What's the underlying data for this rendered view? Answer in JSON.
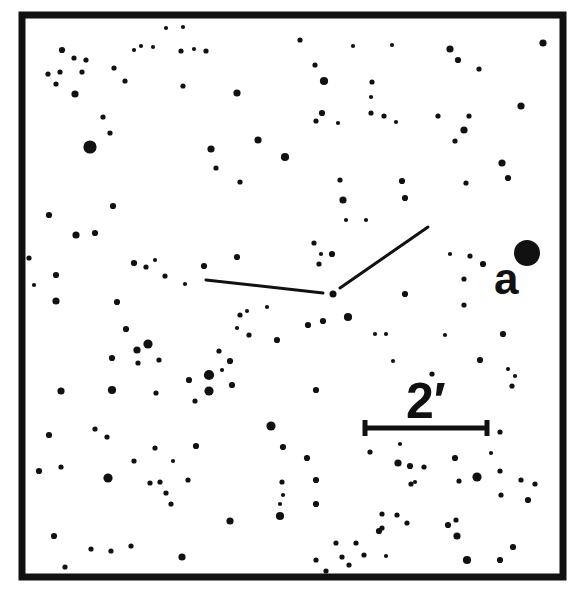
{
  "chart_data": {
    "type": "finder-chart",
    "title": "",
    "frame": {
      "x": 22,
      "y": 15,
      "width": 541,
      "height": 562,
      "stroke_width": 7
    },
    "pointer_lines": {
      "apex": {
        "x": 333,
        "y": 294
      },
      "arms": [
        {
          "from": [
            206,
            280
          ],
          "to": [
            323,
            293
          ]
        },
        {
          "from": [
            340,
            288
          ],
          "to": [
            428,
            227
          ]
        }
      ]
    },
    "labels": [
      {
        "id": "a",
        "text": "a",
        "x": 494,
        "y": 294,
        "marks_star": {
          "x": 527,
          "y": 253
        }
      }
    ],
    "scale_bar": {
      "label": "2′",
      "x1": 365,
      "x2": 487,
      "y": 428,
      "text_x": 406,
      "text_y": 418
    },
    "stars": [
      [
        62,
        50,
        5
      ],
      [
        74,
        58,
        4
      ],
      [
        86,
        60,
        4
      ],
      [
        48,
        74,
        4
      ],
      [
        60,
        72,
        4
      ],
      [
        82,
        72,
        4
      ],
      [
        56,
        84,
        4
      ],
      [
        75,
        94,
        6
      ],
      [
        114,
        68,
        4
      ],
      [
        125,
        81,
        4
      ],
      [
        134,
        50,
        3
      ],
      [
        141,
        46,
        3
      ],
      [
        153,
        47,
        3
      ],
      [
        166,
        28,
        3
      ],
      [
        183,
        27,
        3
      ],
      [
        181,
        51,
        4
      ],
      [
        194,
        49,
        3
      ],
      [
        206,
        51,
        4
      ],
      [
        183,
        86,
        4
      ],
      [
        237,
        93,
        6
      ],
      [
        103,
        117,
        4
      ],
      [
        110,
        133,
        4
      ],
      [
        90,
        147,
        12
      ],
      [
        211,
        149,
        6
      ],
      [
        216,
        168,
        4
      ],
      [
        240,
        182,
        4
      ],
      [
        258,
        140,
        6
      ],
      [
        285,
        157,
        7
      ],
      [
        300,
        40,
        4
      ],
      [
        353,
        46,
        3
      ],
      [
        392,
        45,
        3
      ],
      [
        450,
        49,
        6
      ],
      [
        458,
        60,
        5
      ],
      [
        479,
        69,
        4
      ],
      [
        315,
        65,
        4
      ],
      [
        324,
        81,
        7
      ],
      [
        372,
        82,
        4
      ],
      [
        371,
        97,
        3
      ],
      [
        384,
        116,
        4
      ],
      [
        371,
        113,
        4
      ],
      [
        396,
        122,
        3
      ],
      [
        322,
        113,
        5
      ],
      [
        316,
        121,
        4
      ],
      [
        338,
        123,
        3
      ],
      [
        438,
        116,
        4
      ],
      [
        464,
        130,
        6
      ],
      [
        469,
        116,
        4
      ],
      [
        455,
        141,
        4
      ],
      [
        521,
        106,
        6
      ],
      [
        543,
        43,
        6
      ],
      [
        502,
        163,
        6
      ],
      [
        508,
        178,
        5
      ],
      [
        466,
        183,
        4
      ],
      [
        402,
        181,
        5
      ],
      [
        405,
        198,
        5
      ],
      [
        340,
        180,
        4
      ],
      [
        49,
        215,
        5
      ],
      [
        76,
        235,
        6
      ],
      [
        95,
        233,
        5
      ],
      [
        113,
        206,
        5
      ],
      [
        29,
        258,
        4
      ],
      [
        34,
        285,
        3
      ],
      [
        56,
        275,
        5
      ],
      [
        56,
        301,
        6
      ],
      [
        134,
        263,
        5
      ],
      [
        146,
        267,
        4
      ],
      [
        155,
        260,
        3
      ],
      [
        165,
        276,
        4
      ],
      [
        185,
        284,
        3
      ],
      [
        204,
        266,
        5
      ],
      [
        237,
        257,
        5
      ],
      [
        343,
        200,
        6
      ],
      [
        346,
        220,
        3
      ],
      [
        366,
        220,
        3
      ],
      [
        314,
        243,
        4
      ],
      [
        321,
        254,
        3
      ],
      [
        319,
        264,
        4
      ],
      [
        332,
        254,
        5
      ],
      [
        450,
        254,
        3
      ],
      [
        470,
        256,
        4
      ],
      [
        483,
        264,
        5
      ],
      [
        464,
        279,
        4
      ],
      [
        464,
        305,
        4
      ],
      [
        405,
        294,
        5
      ],
      [
        219,
        351,
        4
      ],
      [
        222,
        370,
        3
      ],
      [
        230,
        361,
        5
      ],
      [
        249,
        335,
        4
      ],
      [
        240,
        315,
        4
      ],
      [
        237,
        328,
        3
      ],
      [
        247,
        311,
        3
      ],
      [
        267,
        307,
        3
      ],
      [
        277,
        340,
        5
      ],
      [
        308,
        325,
        5
      ],
      [
        323,
        321,
        5
      ],
      [
        348,
        317,
        7
      ],
      [
        117,
        302,
        5
      ],
      [
        126,
        329,
        5
      ],
      [
        137,
        350,
        6
      ],
      [
        148,
        344,
        8
      ],
      [
        112,
        358,
        5
      ],
      [
        138,
        363,
        4
      ],
      [
        112,
        390,
        7
      ],
      [
        61,
        391,
        6
      ],
      [
        95,
        429,
        4
      ],
      [
        156,
        393,
        4
      ],
      [
        209,
        375,
        9
      ],
      [
        209,
        391,
        8
      ],
      [
        232,
        385,
        5
      ],
      [
        159,
        360,
        4
      ],
      [
        195,
        401,
        4
      ],
      [
        173,
        461,
        3
      ],
      [
        189,
        380,
        5
      ],
      [
        316,
        390,
        5
      ],
      [
        375,
        334,
        3
      ],
      [
        386,
        334,
        3
      ],
      [
        445,
        335,
        3
      ],
      [
        503,
        334,
        5
      ],
      [
        480,
        360,
        5
      ],
      [
        393,
        361,
        3
      ],
      [
        432,
        374,
        4
      ],
      [
        508,
        369,
        3
      ],
      [
        515,
        376,
        3
      ],
      [
        512,
        386,
        4
      ],
      [
        49,
        435,
        5
      ],
      [
        107,
        437,
        4
      ],
      [
        134,
        461,
        4
      ],
      [
        155,
        448,
        4
      ],
      [
        39,
        471,
        5
      ],
      [
        61,
        467,
        4
      ],
      [
        108,
        478,
        8
      ],
      [
        150,
        483,
        4
      ],
      [
        160,
        482,
        4
      ],
      [
        188,
        480,
        4
      ],
      [
        166,
        493,
        4
      ],
      [
        171,
        504,
        4
      ],
      [
        230,
        521,
        6
      ],
      [
        196,
        446,
        5
      ],
      [
        271,
        426,
        8
      ],
      [
        283,
        447,
        5
      ],
      [
        282,
        482,
        4
      ],
      [
        283,
        495,
        3
      ],
      [
        280,
        504,
        3
      ],
      [
        280,
        516,
        7
      ],
      [
        54,
        536,
        5
      ],
      [
        91,
        549,
        4
      ],
      [
        111,
        551,
        4
      ],
      [
        131,
        546,
        4
      ],
      [
        182,
        557,
        6
      ],
      [
        65,
        567,
        4
      ],
      [
        415,
        482,
        3
      ],
      [
        400,
        444,
        3
      ],
      [
        398,
        463,
        6
      ],
      [
        410,
        466,
        5
      ],
      [
        424,
        467,
        4
      ],
      [
        411,
        484,
        4
      ],
      [
        307,
        458,
        5
      ],
      [
        455,
        458,
        5
      ],
      [
        459,
        481,
        4
      ],
      [
        477,
        477,
        8
      ],
      [
        500,
        471,
        4
      ],
      [
        501,
        495,
        4
      ],
      [
        521,
        480,
        4
      ],
      [
        535,
        484,
        4
      ],
      [
        528,
        500,
        5
      ],
      [
        500,
        432,
        4
      ],
      [
        491,
        453,
        3
      ],
      [
        448,
        525,
        5
      ],
      [
        456,
        520,
        4
      ],
      [
        457,
        536,
        6
      ],
      [
        513,
        547,
        5
      ],
      [
        370,
        452,
        4
      ],
      [
        316,
        480,
        5
      ],
      [
        356,
        543,
        4
      ],
      [
        382,
        514,
        4
      ],
      [
        382,
        528,
        4
      ],
      [
        379,
        531,
        5
      ],
      [
        397,
        515,
        4
      ],
      [
        407,
        523,
        4
      ],
      [
        336,
        543,
        4
      ],
      [
        342,
        557,
        4
      ],
      [
        386,
        556,
        3
      ],
      [
        364,
        555,
        4
      ],
      [
        349,
        565,
        4
      ],
      [
        316,
        504,
        5
      ],
      [
        467,
        560,
        7
      ],
      [
        500,
        560,
        5
      ],
      [
        316,
        560,
        4
      ],
      [
        326,
        571,
        4
      ]
    ]
  }
}
